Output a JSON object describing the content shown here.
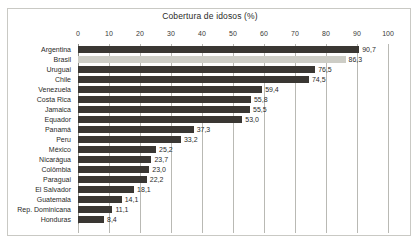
{
  "chart_data": {
    "type": "bar",
    "orientation": "horizontal",
    "title": "Cobertura de idosos (%)",
    "xlabel": "",
    "ylabel": "",
    "xlim": [
      0,
      100
    ],
    "xticks": [
      0,
      10,
      20,
      30,
      40,
      50,
      60,
      70,
      80,
      90,
      100
    ],
    "xtick_labels": [
      "0",
      "10",
      "20",
      "30",
      "40",
      "50",
      "60",
      "70",
      "80",
      "90",
      "100"
    ],
    "grid": true,
    "legend": false,
    "decimal_separator": ",",
    "categories": [
      "Argentina",
      "Brasil",
      "Uruguai",
      "Chile",
      "Venezuela",
      "Costa Rica",
      "Jamaica",
      "Equador",
      "Panamá",
      "Peru",
      "México",
      "Nicarágua",
      "Colômbia",
      "Paraguai",
      "El Salvador",
      "Guatemala",
      "Rep. Dominicana",
      "Honduras"
    ],
    "values": [
      90.7,
      86.3,
      76.5,
      74.5,
      59.4,
      55.8,
      55.5,
      53.0,
      37.3,
      33.2,
      25.2,
      23.7,
      23.0,
      22.2,
      18.1,
      14.1,
      11.1,
      8.4
    ],
    "value_labels": [
      "90,7",
      "86,3",
      "76,5",
      "74,5",
      "59,4",
      "55,8",
      "55,5",
      "53,0",
      "37,3",
      "33,2",
      "25,2",
      "23,7",
      "23,0",
      "22,2",
      "18,1",
      "14,1",
      "11,1",
      "8,4"
    ],
    "highlight_category": "Brasil",
    "colors": {
      "bar": "#3a3733",
      "bar_highlight": "#cdcdc6",
      "gridline": "#b9b9b4",
      "axis": "#8d8d88",
      "text": "#2a2a28",
      "frame": "#c9c9c4",
      "background": "#ffffff"
    }
  }
}
